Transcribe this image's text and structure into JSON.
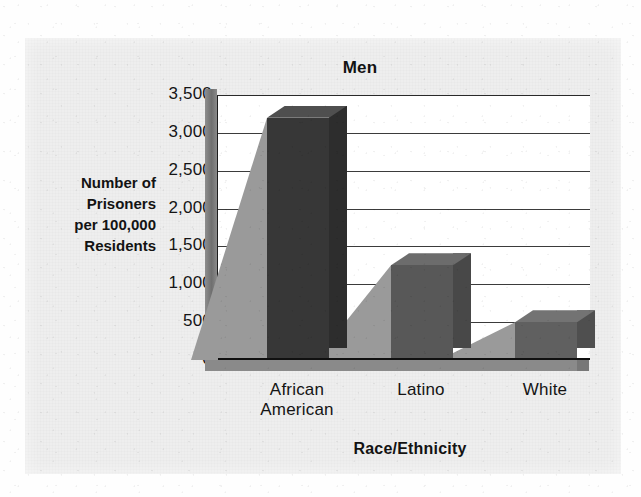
{
  "chart_data": {
    "type": "bar",
    "title": "Men",
    "xlabel": "Race/Ethnicity",
    "ylabel": "Number of Prisoners per 100,000 Residents",
    "ylabel_lines": [
      "Number of",
      "Prisoners",
      "per 100,000",
      "Residents"
    ],
    "categories": [
      "African American",
      "Latino",
      "White"
    ],
    "category_lines": [
      [
        "African",
        "American"
      ],
      [
        "Latino"
      ],
      [
        "White"
      ]
    ],
    "values": [
      3200,
      1250,
      500
    ],
    "ylim": [
      0,
      3500
    ],
    "ytick_values": [
      3500,
      3000,
      2500,
      2000,
      1500,
      1000,
      500,
      0
    ],
    "ytick_labels": [
      "3,500",
      "3,000",
      "2,500",
      "2,000",
      "1,500",
      "1,000",
      "500",
      "0"
    ],
    "grid": true,
    "legend": false,
    "style": "3d-column",
    "bar_colors": [
      "#373737",
      "#585858",
      "#606060"
    ]
  },
  "colors": {
    "page_background": "#fefefe",
    "card_background": "#eeeeee",
    "plot_background": "#ffffff",
    "axis": "#101010",
    "gridline": "#3b3b3b",
    "text": "#131313",
    "wall_3d": "#7a7a7a",
    "floor_3d": "#8a8a8a",
    "shadow_3d": "#9a9a9a"
  }
}
